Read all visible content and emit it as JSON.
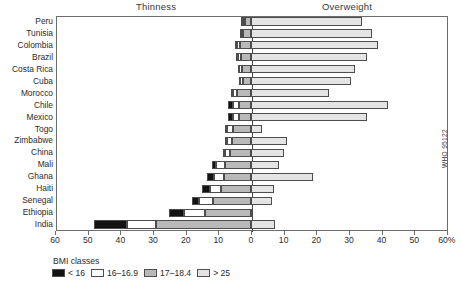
{
  "titles": {
    "left": "Thinness",
    "right": "Overweight"
  },
  "source": "WHO 95122",
  "legend": {
    "title": "BMI classes",
    "items": [
      {
        "label": "< 16",
        "color": "#131313",
        "key": "u16"
      },
      {
        "label": "16–16.9",
        "color": "#ffffff",
        "key": "c16"
      },
      {
        "label": "17–18.4",
        "color": "#b9b9b9",
        "key": "c17"
      },
      {
        "label": "> 25",
        "color": "#e4e4e4",
        "key": "ow"
      }
    ]
  },
  "axis": {
    "ticks": [
      {
        "value": -60,
        "label": "60"
      },
      {
        "value": -50,
        "label": "50"
      },
      {
        "value": -40,
        "label": "40"
      },
      {
        "value": -30,
        "label": "30"
      },
      {
        "value": -20,
        "label": "20"
      },
      {
        "value": -10,
        "label": "10"
      },
      {
        "value": 0,
        "label": "0"
      },
      {
        "value": 10,
        "label": "10"
      },
      {
        "value": 20,
        "label": "20"
      },
      {
        "value": 30,
        "label": "30"
      },
      {
        "value": 40,
        "label": "40"
      },
      {
        "value": 50,
        "label": "50"
      },
      {
        "value": 60,
        "label": "60%"
      }
    ]
  },
  "chart_data": {
    "type": "bar",
    "orientation": "horizontal",
    "subtype": "diverging-stacked",
    "title": "",
    "xlabel": "%",
    "ylabel": "",
    "xlim": [
      -60,
      60
    ],
    "grid": false,
    "legend_position": "bottom-left",
    "categories": [
      "Peru",
      "Tunisia",
      "Colombia",
      "Brazil",
      "Costa Rica",
      "Cuba",
      "Morocco",
      "Chile",
      "Mexico",
      "Togo",
      "Zimbabwe",
      "China",
      "Mali",
      "Ghana",
      "Haiti",
      "Senegal",
      "Ethiopia",
      "India"
    ],
    "series": [
      {
        "name": "< 16",
        "side": "left",
        "color": "#131313",
        "values": [
          0.5,
          0.4,
          0.7,
          0.6,
          0.4,
          0.3,
          0.6,
          1.6,
          1.5,
          0.8,
          0.7,
          0.6,
          1.3,
          2.1,
          2.4,
          2.0,
          4.5,
          10.0
        ]
      },
      {
        "name": "16–16.9",
        "side": "left",
        "color": "#ffffff",
        "values": [
          0.6,
          0.8,
          1.0,
          0.9,
          0.8,
          0.7,
          1.2,
          1.8,
          1.7,
          1.6,
          1.5,
          1.5,
          2.6,
          3.0,
          3.4,
          4.5,
          6.5,
          9.0
        ]
      },
      {
        "name": "17–18.4",
        "side": "left",
        "color": "#b9b9b9",
        "values": [
          1.9,
          2.3,
          3.3,
          3.0,
          2.8,
          2.6,
          4.2,
          3.6,
          3.8,
          5.6,
          5.8,
          6.4,
          8.1,
          8.4,
          9.2,
          11.5,
          14.0,
          29.0
        ]
      },
      {
        "name": "> 25",
        "side": "right",
        "color": "#e4e4e4",
        "values": [
          34.0,
          37.0,
          39.0,
          35.5,
          32.0,
          30.5,
          24.0,
          42.0,
          35.5,
          3.5,
          11.0,
          10.0,
          8.5,
          19.0,
          7.0,
          6.5,
          0.7,
          7.5
        ]
      }
    ]
  }
}
